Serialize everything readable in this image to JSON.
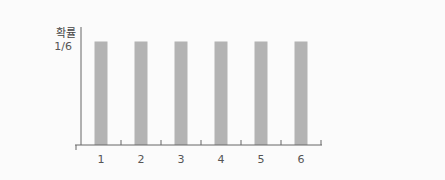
{
  "chart_data": {
    "type": "bar",
    "title": "",
    "xlabel": "",
    "ylabel": "확률",
    "categories": [
      "1",
      "2",
      "3",
      "4",
      "5",
      "6"
    ],
    "values": [
      0.16667,
      0.16667,
      0.16667,
      0.16667,
      0.16667,
      0.16667
    ],
    "y_ticks": [
      {
        "value": 0.16667,
        "label": "1/6"
      }
    ],
    "ylim": [
      0,
      0.19
    ],
    "grid": false,
    "legend": "none",
    "colors": {
      "bar": "#b3b3b3",
      "axis": "#666666",
      "text": "#555555"
    }
  }
}
